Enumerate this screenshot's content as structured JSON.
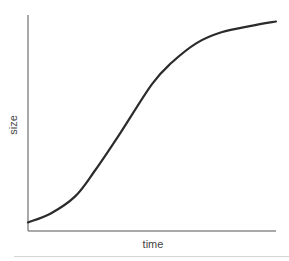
{
  "chart_data": {
    "type": "line",
    "title": "",
    "xlabel": "time",
    "ylabel": "size",
    "grid": false,
    "legend": null,
    "series": [
      {
        "name": "growth",
        "shape": "sigmoid (logistic) growth curve",
        "points": [
          {
            "x": 0.0,
            "y": 0.04
          },
          {
            "x": 0.09,
            "y": 0.08
          },
          {
            "x": 0.19,
            "y": 0.16
          },
          {
            "x": 0.27,
            "y": 0.28
          },
          {
            "x": 0.37,
            "y": 0.45
          },
          {
            "x": 0.5,
            "y": 0.68
          },
          {
            "x": 0.58,
            "y": 0.78
          },
          {
            "x": 0.68,
            "y": 0.87
          },
          {
            "x": 0.78,
            "y": 0.92
          },
          {
            "x": 0.9,
            "y": 0.95
          },
          {
            "x": 1.0,
            "y": 0.97
          }
        ]
      }
    ],
    "xlim": [
      0,
      1
    ],
    "ylim": [
      0,
      1
    ],
    "ticks": "none"
  },
  "colors": {
    "curve": "#2b2b2b",
    "axis": "#8c8c8c",
    "label": "#444444",
    "divider": "#d6d6d6"
  }
}
